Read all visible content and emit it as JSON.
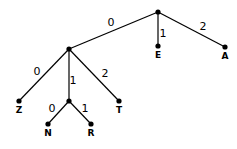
{
  "diagram": {
    "type": "tree",
    "nodes": [
      {
        "id": "root",
        "x": 158,
        "y": 12,
        "label": ""
      },
      {
        "id": "n1",
        "x": 69,
        "y": 49,
        "label": ""
      },
      {
        "id": "E",
        "x": 158,
        "y": 46,
        "label": "E"
      },
      {
        "id": "A",
        "x": 225,
        "y": 47,
        "label": "A"
      },
      {
        "id": "Z",
        "x": 19,
        "y": 101,
        "label": "Z"
      },
      {
        "id": "n2",
        "x": 69,
        "y": 101,
        "label": ""
      },
      {
        "id": "T",
        "x": 119,
        "y": 101,
        "label": "T"
      },
      {
        "id": "N",
        "x": 48,
        "y": 124,
        "label": "N"
      },
      {
        "id": "R",
        "x": 91,
        "y": 124,
        "label": "R"
      }
    ],
    "edges": [
      {
        "from": "root",
        "to": "n1",
        "label": "0",
        "lx": 111,
        "ly": 26
      },
      {
        "from": "root",
        "to": "E",
        "label": "1",
        "lx": 163,
        "ly": 37
      },
      {
        "from": "root",
        "to": "A",
        "label": "2",
        "lx": 203,
        "ly": 30
      },
      {
        "from": "n1",
        "to": "Z",
        "label": "0",
        "lx": 37,
        "ly": 75
      },
      {
        "from": "n1",
        "to": "n2",
        "label": "1",
        "lx": 73,
        "ly": 84
      },
      {
        "from": "n1",
        "to": "T",
        "label": "2",
        "lx": 105,
        "ly": 77
      },
      {
        "from": "n2",
        "to": "N",
        "label": "0",
        "lx": 52,
        "ly": 112
      },
      {
        "from": "n2",
        "to": "R",
        "label": "1",
        "lx": 85,
        "ly": 112
      }
    ]
  }
}
